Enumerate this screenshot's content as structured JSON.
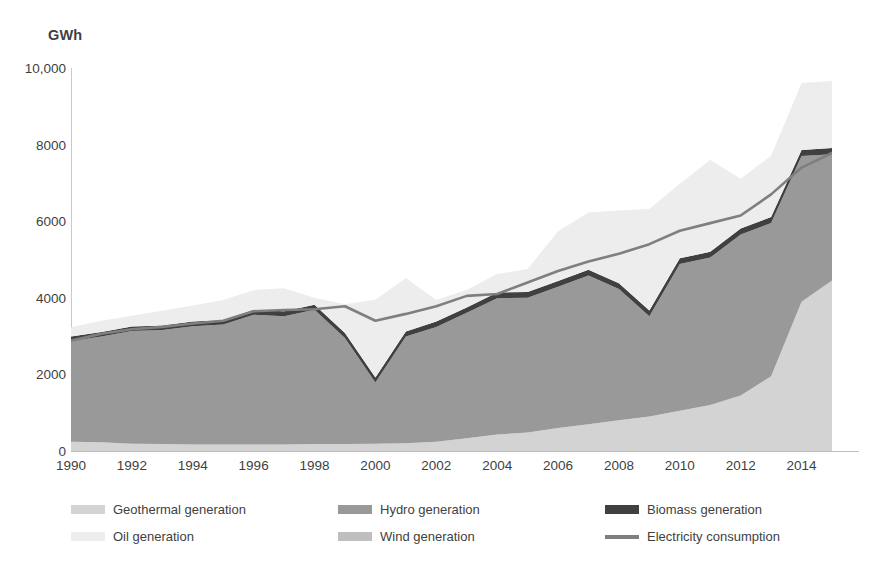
{
  "chart_data": {
    "type": "area",
    "title": "",
    "subtitle": "",
    "xlabel": "",
    "ylabel": "GWh",
    "y_unit_label": "GWh",
    "stacked": true,
    "grid": false,
    "legend_position": "bottom",
    "xlim": [
      1990,
      2015
    ],
    "ylim": [
      0,
      10000
    ],
    "y_ticks": [
      "0",
      "2000",
      "4000",
      "6000",
      "8000",
      "10,000"
    ],
    "y_tick_values": [
      0,
      2000,
      4000,
      6000,
      8000,
      10000
    ],
    "x_ticks": [
      "1990",
      "1992",
      "1994",
      "1996",
      "1998",
      "2000",
      "2002",
      "2004",
      "2006",
      "2008",
      "2010",
      "2012",
      "2014"
    ],
    "x_tick_values": [
      1990,
      1992,
      1994,
      1996,
      1998,
      2000,
      2002,
      2004,
      2006,
      2008,
      2010,
      2012,
      2014
    ],
    "x": [
      1990,
      1991,
      1992,
      1993,
      1994,
      1995,
      1996,
      1997,
      1998,
      1999,
      2000,
      2001,
      2002,
      2003,
      2004,
      2005,
      2006,
      2007,
      2008,
      2009,
      2010,
      2011,
      2012,
      2013,
      2014,
      2015
    ],
    "series": [
      {
        "name": "Geothermal generation",
        "color": "#d3d3d3",
        "kind": "area",
        "values": [
          240,
          230,
          190,
          180,
          170,
          170,
          170,
          170,
          180,
          180,
          190,
          200,
          240,
          330,
          430,
          480,
          600,
          700,
          800,
          900,
          1050,
          1200,
          1450,
          1950,
          3900,
          4450
        ]
      },
      {
        "name": "Hydro generation",
        "color": "#999999",
        "kind": "area",
        "values": [
          2630,
          2760,
          2940,
          2980,
          3090,
          3130,
          3390,
          3350,
          3510,
          2770,
          1600,
          2790,
          3000,
          3280,
          3560,
          3520,
          3690,
          3880,
          3430,
          2620,
          3830,
          3850,
          4200,
          4000,
          3800,
          3300
        ]
      },
      {
        "name": "Biomass generation",
        "color": "#404040",
        "kind": "area",
        "values": [
          120,
          120,
          120,
          120,
          120,
          120,
          130,
          130,
          130,
          130,
          130,
          130,
          140,
          140,
          150,
          150,
          150,
          150,
          150,
          150,
          150,
          150,
          160,
          160,
          160,
          160
        ]
      },
      {
        "name": "Oil generation",
        "color": "#ededed",
        "kind": "area",
        "values": [
          240,
          290,
          280,
          380,
          420,
          520,
          510,
          600,
          180,
          750,
          2030,
          1400,
          560,
          460,
          480,
          600,
          1300,
          1500,
          1900,
          2650,
          1950,
          2400,
          1300,
          1600,
          1750,
          1750
        ]
      },
      {
        "name": "Wind generation",
        "color": "#bfbfbf",
        "kind": "area",
        "values": [
          0,
          0,
          0,
          0,
          0,
          0,
          0,
          0,
          0,
          0,
          0,
          0,
          0,
          0,
          0,
          0,
          0,
          0,
          0,
          0,
          0,
          0,
          0,
          0,
          0,
          0
        ]
      },
      {
        "name": "Electricity consumption",
        "color": "#7f7f7f",
        "kind": "line",
        "values": [
          2880,
          3060,
          3180,
          3240,
          3330,
          3400,
          3650,
          3680,
          3700,
          3780,
          3400,
          3580,
          3780,
          4050,
          4100,
          4400,
          4700,
          4950,
          5150,
          5400,
          5750,
          5950,
          6150,
          6700,
          7400,
          7780
        ]
      }
    ]
  },
  "legend": {
    "columns": [
      {
        "items": [
          {
            "label": "Geothermal generation",
            "swatch_color": "#d3d3d3",
            "style": "area"
          },
          {
            "label": "Oil generation",
            "swatch_color": "#ededed",
            "style": "area"
          }
        ]
      },
      {
        "items": [
          {
            "label": "Hydro generation",
            "swatch_color": "#999999",
            "style": "area"
          },
          {
            "label": "Wind generation",
            "swatch_color": "#bfbfbf",
            "style": "area"
          }
        ]
      },
      {
        "items": [
          {
            "label": "Biomass generation",
            "swatch_color": "#404040",
            "style": "area"
          },
          {
            "label": "Electricity consumption",
            "swatch_color": "#7f7f7f",
            "style": "line"
          }
        ]
      }
    ]
  },
  "colors": {
    "geothermal": "#d3d3d3",
    "hydro": "#999999",
    "biomass": "#404040",
    "oil": "#ededed",
    "wind": "#bfbfbf",
    "consumption_line": "#7f7f7f",
    "axis": "#bdbdbd",
    "text": "#3f3f3f",
    "background": "#ffffff"
  }
}
